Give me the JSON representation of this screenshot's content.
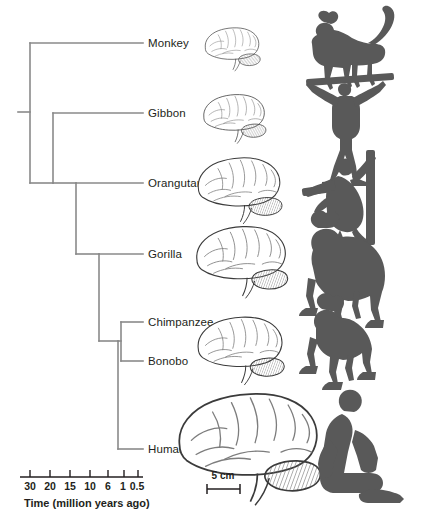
{
  "figure": {
    "line_color": "#8a8a8a",
    "ink_color": "#231f20",
    "silhouette_color": "#595959",
    "background": "#ffffff"
  },
  "tips": [
    {
      "label": "Monkey",
      "y": 43,
      "node_x": 30
    },
    {
      "label": "Gibbon",
      "y": 113,
      "node_x": 53
    },
    {
      "label": "Orangutan",
      "y": 183,
      "node_x": 76
    },
    {
      "label": "Gorilla",
      "y": 254,
      "node_x": 99
    },
    {
      "label": "Chimpanzee",
      "y": 322,
      "node_x": 121
    },
    {
      "label": "Bonobo",
      "y": 361,
      "node_x": 121
    },
    {
      "label": "Human",
      "y": 449,
      "node_x": 118
    }
  ],
  "time_axis": {
    "caption": "Time (million years ago)",
    "ticks": [
      {
        "value": "30",
        "x": 30
      },
      {
        "value": "20",
        "x": 50
      },
      {
        "value": "15",
        "x": 70
      },
      {
        "value": "10",
        "x": 90
      },
      {
        "value": "6",
        "x": 108
      },
      {
        "value": "1",
        "x": 124
      },
      {
        "value": "0.5",
        "x": 138
      }
    ],
    "axis_y": 477,
    "axis_x_start": 20,
    "axis_x_end": 143
  },
  "scale_bar": {
    "label": "5 cm",
    "x_start": 207,
    "x_end": 240,
    "y": 489
  },
  "brains": [
    {
      "name": "monkey-brain",
      "cx": 232,
      "cy": 45,
      "scale": 0.46
    },
    {
      "name": "gibbon-brain",
      "cx": 234,
      "cy": 114,
      "scale": 0.52
    },
    {
      "name": "orangutan-brain",
      "cx": 239,
      "cy": 184,
      "scale": 0.7
    },
    {
      "name": "gorilla-brain",
      "cx": 241,
      "cy": 255,
      "scale": 0.76
    },
    {
      "name": "chimpanzee-brain",
      "cx": 240,
      "cy": 344,
      "scale": 0.72
    },
    {
      "name": "human-brain",
      "cx": 248,
      "cy": 438,
      "scale": 1.18
    }
  ],
  "silhouettes": [
    {
      "name": "monkey-silhouette",
      "label": "Monkey"
    },
    {
      "name": "gibbon-silhouette",
      "label": "Gibbon"
    },
    {
      "name": "orangutan-silhouette",
      "label": "Orangutan"
    },
    {
      "name": "gorilla-silhouette",
      "label": "Gorilla"
    },
    {
      "name": "chimpanzee-silhouette",
      "label": "Chimpanzee"
    },
    {
      "name": "human-silhouette",
      "label": "Human"
    }
  ]
}
